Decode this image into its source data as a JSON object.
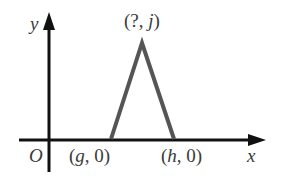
{
  "diagram": {
    "axes": {
      "x_label": "x",
      "y_label": "y",
      "origin_label": "O",
      "axis_color": "#111111"
    },
    "triangle": {
      "color": "#555555",
      "apex_label_open": "(?, ",
      "apex_label_var": "j",
      "apex_label_close": ")",
      "left_vertex_label_open": "(",
      "left_vertex_label_var": "g",
      "left_vertex_label_close": ", 0)",
      "right_vertex_label_open": "(",
      "right_vertex_label_var": "h",
      "right_vertex_label_close": ", 0)"
    }
  }
}
